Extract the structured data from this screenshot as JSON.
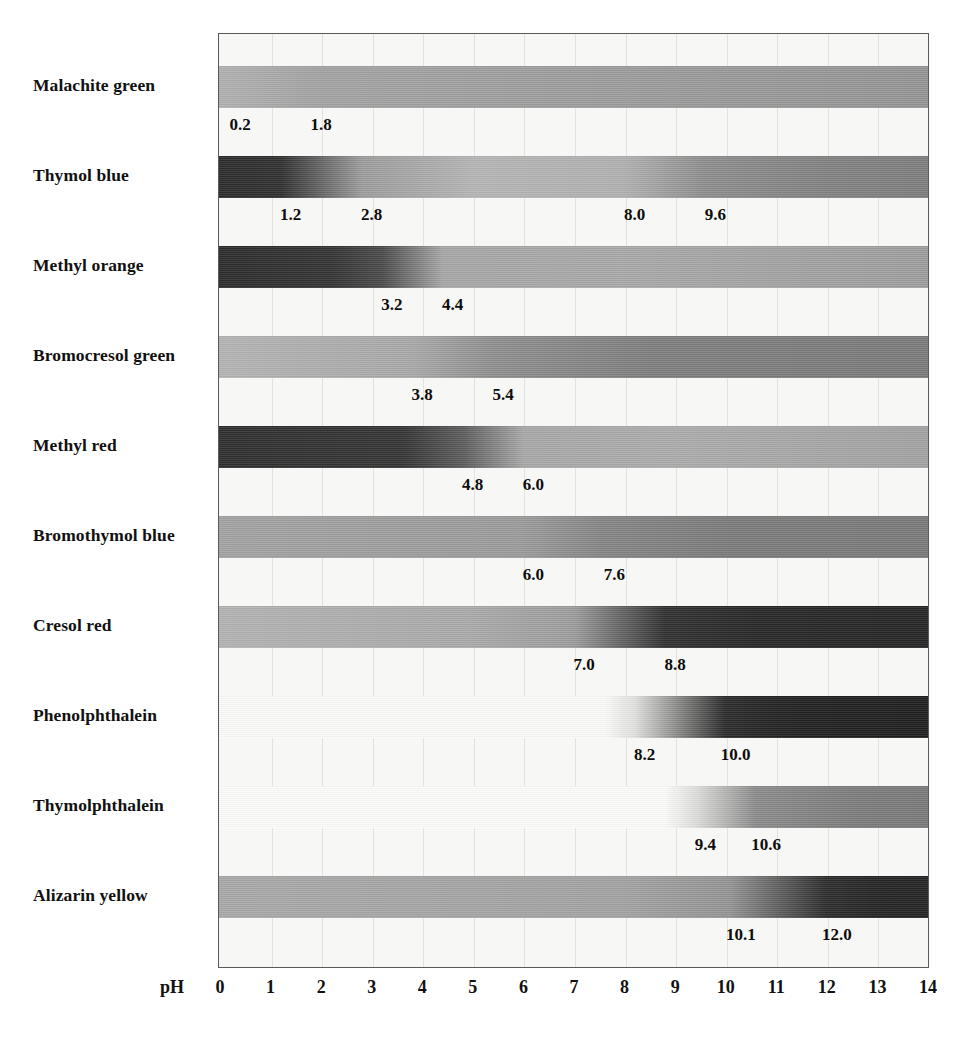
{
  "figure": {
    "kind": "ph-indicator-transition-chart",
    "axis_caption": "pH",
    "axis_ticks": [
      "0",
      "1",
      "2",
      "3",
      "4",
      "5",
      "6",
      "7",
      "8",
      "9",
      "10",
      "11",
      "12",
      "13",
      "14"
    ]
  },
  "chart_data": {
    "type": "bar",
    "title": "",
    "subtitle": "",
    "xlabel": "pH",
    "ylabel": "",
    "xlim": [
      0,
      14
    ],
    "xticks": [
      0,
      1,
      2,
      3,
      4,
      5,
      6,
      7,
      8,
      9,
      10,
      11,
      12,
      13,
      14
    ],
    "grid": true,
    "legend": "none",
    "categories": [
      "Malachite green",
      "Thymol blue",
      "Methyl orange",
      "Bromocresol green",
      "Methyl red",
      "Bromothymol blue",
      "Cresol red",
      "Phenolphthalein",
      "Thymolphthalein",
      "Alizarin yellow"
    ],
    "series": [
      {
        "name": "transition range low",
        "values": [
          0.2,
          1.2,
          3.2,
          3.8,
          4.8,
          6.0,
          7.0,
          8.2,
          9.4,
          10.1
        ]
      },
      {
        "name": "transition range high",
        "values": [
          1.8,
          2.8,
          4.4,
          5.4,
          6.0,
          7.6,
          8.8,
          10.0,
          10.6,
          12.0
        ]
      },
      {
        "name": "second transition range low",
        "values": [
          null,
          8.0,
          null,
          null,
          null,
          null,
          null,
          null,
          null,
          null
        ]
      },
      {
        "name": "second transition range high",
        "values": [
          null,
          9.6,
          null,
          null,
          null,
          null,
          null,
          null,
          null,
          null
        ]
      }
    ],
    "rows": [
      {
        "indicator": "Malachite green",
        "labels": [
          "0.2",
          "1.8"
        ],
        "label_ph": [
          0.2,
          1.8
        ],
        "low": 0.2,
        "high": 1.8,
        "acid_tone": "#a6a6a6",
        "base_tone": "#9a9a9a",
        "stops": [
          {
            "ph": 0.0,
            "color": "#b0b0b0"
          },
          {
            "ph": 1.8,
            "color": "#a3a3a3"
          },
          {
            "ph": 14.0,
            "color": "#949494"
          }
        ]
      },
      {
        "indicator": "Thymol blue",
        "labels": [
          "1.2",
          "2.8",
          "8.0",
          "9.6"
        ],
        "label_ph": [
          1.2,
          2.8,
          8.0,
          9.6
        ],
        "low": 1.2,
        "high": 2.8,
        "low2": 8.0,
        "high2": 9.6,
        "acid_tone": "#2e2e2e",
        "base_tone": "#8a8a8a",
        "stops": [
          {
            "ph": 0.0,
            "color": "#2b2b2b"
          },
          {
            "ph": 1.2,
            "color": "#303030"
          },
          {
            "ph": 2.8,
            "color": "#9c9c9c"
          },
          {
            "ph": 5.0,
            "color": "#b4b4b4"
          },
          {
            "ph": 8.0,
            "color": "#b0b0b0"
          },
          {
            "ph": 9.6,
            "color": "#8d8d8d"
          },
          {
            "ph": 12.0,
            "color": "#818181"
          },
          {
            "ph": 14.0,
            "color": "#7d7d7d"
          }
        ]
      },
      {
        "indicator": "Methyl orange",
        "labels": [
          "3.2",
          "4.4"
        ],
        "label_ph": [
          3.2,
          4.4
        ],
        "low": 3.2,
        "high": 4.4,
        "acid_tone": "#2d2d2d",
        "base_tone": "#a0a0a0",
        "stops": [
          {
            "ph": 0.0,
            "color": "#2b2b2b"
          },
          {
            "ph": 2.2,
            "color": "#333333"
          },
          {
            "ph": 3.2,
            "color": "#4a4a4a"
          },
          {
            "ph": 4.4,
            "color": "#a6a6a6"
          },
          {
            "ph": 8.0,
            "color": "#a8a8a8"
          },
          {
            "ph": 14.0,
            "color": "#9d9d9d"
          }
        ]
      },
      {
        "indicator": "Bromocresol green",
        "labels": [
          "3.8",
          "5.4"
        ],
        "label_ph": [
          3.8,
          5.4
        ],
        "low": 3.8,
        "high": 5.4,
        "acid_tone": "#aeaeae",
        "base_tone": "#808080",
        "stops": [
          {
            "ph": 0.0,
            "color": "#b3b3b3"
          },
          {
            "ph": 3.8,
            "color": "#a8a8a8"
          },
          {
            "ph": 5.4,
            "color": "#8e8e8e"
          },
          {
            "ph": 8.5,
            "color": "#7e7e7e"
          },
          {
            "ph": 14.0,
            "color": "#7a7a7a"
          }
        ]
      },
      {
        "indicator": "Methyl red",
        "labels": [
          "4.8",
          "6.0"
        ],
        "label_ph": [
          4.8,
          6.0
        ],
        "low": 4.8,
        "high": 6.0,
        "acid_tone": "#313131",
        "base_tone": "#aaaaaa",
        "stops": [
          {
            "ph": 0.0,
            "color": "#2e2e2e"
          },
          {
            "ph": 3.6,
            "color": "#343434"
          },
          {
            "ph": 4.8,
            "color": "#5c5c5c"
          },
          {
            "ph": 6.0,
            "color": "#a7a7a7"
          },
          {
            "ph": 9.0,
            "color": "#ababab"
          },
          {
            "ph": 14.0,
            "color": "#a2a2a2"
          }
        ]
      },
      {
        "indicator": "Bromothymol blue",
        "labels": [
          "6.0",
          "7.6"
        ],
        "label_ph": [
          6.0,
          7.6
        ],
        "low": 6.0,
        "high": 7.6,
        "acid_tone": "#9f9f9f",
        "base_tone": "#787878",
        "stops": [
          {
            "ph": 0.0,
            "color": "#a2a2a2"
          },
          {
            "ph": 6.0,
            "color": "#9a9a9a"
          },
          {
            "ph": 7.6,
            "color": "#848484"
          },
          {
            "ph": 10.0,
            "color": "#7b7b7b"
          },
          {
            "ph": 14.0,
            "color": "#797979"
          }
        ]
      },
      {
        "indicator": "Cresol red",
        "labels": [
          "7.0",
          "8.8"
        ],
        "label_ph": [
          7.0,
          8.8
        ],
        "low": 7.0,
        "high": 8.8,
        "acid_tone": "#aeaeae",
        "base_tone": "#2b2b2b",
        "stops": [
          {
            "ph": 0.0,
            "color": "#b2b2b2"
          },
          {
            "ph": 5.0,
            "color": "#a9a9a9"
          },
          {
            "ph": 7.0,
            "color": "#9c9c9c"
          },
          {
            "ph": 8.8,
            "color": "#303030"
          },
          {
            "ph": 10.5,
            "color": "#272727"
          },
          {
            "ph": 14.0,
            "color": "#242424"
          }
        ]
      },
      {
        "indicator": "Phenolphthalein",
        "labels": [
          "8.2",
          "10.0"
        ],
        "label_ph": [
          8.2,
          10.0
        ],
        "low": 8.2,
        "high": 10.0,
        "acid_tone": "#fbfbfa",
        "base_tone": "#242424",
        "stops": [
          {
            "ph": 0.0,
            "color": "#fafaf8"
          },
          {
            "ph": 7.6,
            "color": "#fafaf8"
          },
          {
            "ph": 8.2,
            "color": "#e0e0de"
          },
          {
            "ph": 10.0,
            "color": "#2a2a2a"
          },
          {
            "ph": 11.5,
            "color": "#202020"
          },
          {
            "ph": 14.0,
            "color": "#1e1e1e"
          }
        ]
      },
      {
        "indicator": "Thymolphthalein",
        "labels": [
          "9.4",
          "10.6"
        ],
        "label_ph": [
          9.4,
          10.6
        ],
        "low": 9.4,
        "high": 10.6,
        "acid_tone": "#fbfbfa",
        "base_tone": "#7e7e7e",
        "stops": [
          {
            "ph": 0.0,
            "color": "#fbfbf9"
          },
          {
            "ph": 8.8,
            "color": "#fbfbf9"
          },
          {
            "ph": 9.4,
            "color": "#dededc"
          },
          {
            "ph": 10.6,
            "color": "#8b8b8b"
          },
          {
            "ph": 12.5,
            "color": "#7c7c7c"
          },
          {
            "ph": 14.0,
            "color": "#797979"
          }
        ]
      },
      {
        "indicator": "Alizarin yellow",
        "labels": [
          "10.1",
          "12.0"
        ],
        "label_ph": [
          10.1,
          12.0
        ],
        "low": 10.1,
        "high": 12.0,
        "acid_tone": "#a5a5a5",
        "base_tone": "#272727",
        "stops": [
          {
            "ph": 0.0,
            "color": "#a8a8a8"
          },
          {
            "ph": 8.0,
            "color": "#a2a2a2"
          },
          {
            "ph": 10.1,
            "color": "#939393"
          },
          {
            "ph": 12.0,
            "color": "#2c2c2c"
          },
          {
            "ph": 13.0,
            "color": "#242424"
          },
          {
            "ph": 14.0,
            "color": "#232323"
          }
        ]
      }
    ]
  }
}
